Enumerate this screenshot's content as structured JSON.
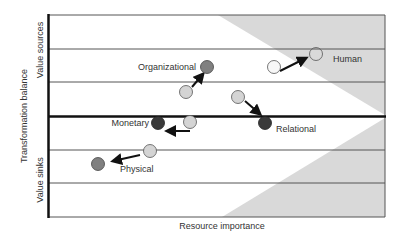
{
  "diagram": {
    "axes": {
      "x_label": "Resource importance",
      "y_label": "Transformation balance",
      "y_upper_label": "Value sources",
      "y_lower_label": "Value sinks"
    },
    "colors": {
      "shade": "#d9d9d9",
      "grid": "#555555",
      "axis": "#111111",
      "dot_light": "#d4d4d4",
      "dot_white": "#f7f7f7",
      "dot_mid": "#808080",
      "dot_dark": "#3a3a3a",
      "arrow": "#111111"
    },
    "resources": [
      {
        "name": "Organizational",
        "from": "light",
        "to": "mid",
        "direction": "up"
      },
      {
        "name": "Human",
        "from": "white",
        "to": "outline",
        "direction": "up"
      },
      {
        "name": "Relational",
        "from": "light",
        "to": "dark",
        "direction": "down"
      },
      {
        "name": "Monetary",
        "from": "light",
        "to": "dark",
        "direction": "left"
      },
      {
        "name": "Physical",
        "from": "light",
        "to": "mid",
        "direction": "down-left"
      }
    ]
  }
}
